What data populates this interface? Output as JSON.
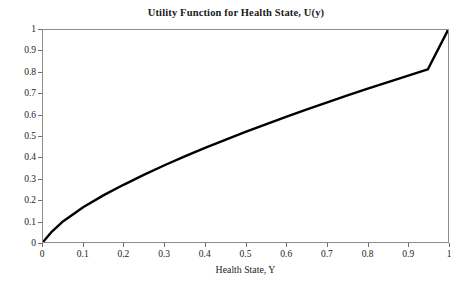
{
  "chart_data": {
    "type": "line",
    "title": "Utility Function for Health State, U(y)",
    "xlabel": "Health State, Y",
    "ylabel": "",
    "xlim": [
      0,
      1
    ],
    "ylim": [
      0,
      1
    ],
    "grid": false,
    "legend": null,
    "xticks": [
      "0",
      "0.1",
      "0.2",
      "0.3",
      "0.4",
      "0.5",
      "0.6",
      "0.7",
      "0.8",
      "0.9",
      "1"
    ],
    "yticks": [
      "0",
      "0.1",
      "0.2",
      "0.3",
      "0.4",
      "0.5",
      "0.6",
      "0.7",
      "0.8",
      "0.9",
      "1"
    ],
    "xtick_values": [
      0,
      0.1,
      0.2,
      0.3,
      0.4,
      0.5,
      0.6,
      0.7,
      0.8,
      0.9,
      1
    ],
    "ytick_values": [
      0,
      0.1,
      0.2,
      0.3,
      0.4,
      0.5,
      0.6,
      0.7,
      0.8,
      0.9,
      1
    ],
    "series": [
      {
        "name": "U(y)",
        "color": "#000000",
        "line_width": 2.4,
        "x": [
          0,
          0.02,
          0.05,
          0.1,
          0.15,
          0.2,
          0.25,
          0.3,
          0.35,
          0.4,
          0.45,
          0.5,
          0.55,
          0.6,
          0.65,
          0.7,
          0.75,
          0.8,
          0.85,
          0.9,
          0.95,
          1
        ],
        "values": [
          0,
          0.045,
          0.098,
          0.165,
          0.221,
          0.271,
          0.318,
          0.362,
          0.404,
          0.444,
          0.482,
          0.519,
          0.555,
          0.59,
          0.624,
          0.657,
          0.69,
          0.722,
          0.753,
          0.784,
          0.814,
          1
        ]
      }
    ],
    "curve_note": "Concave increasing utility curve from (0,0) to (1,1)"
  },
  "axis_colors": {
    "frame": "#8c8c8c",
    "tick": "#6e6e6e",
    "text": "#1c1c1c",
    "curve": "#000000",
    "background": "#ffffff"
  }
}
